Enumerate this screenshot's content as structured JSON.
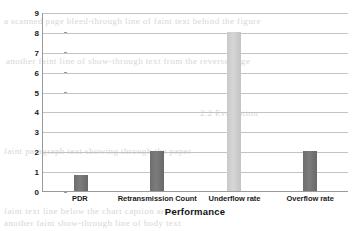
{
  "chart_data": {
    "type": "bar",
    "title": "",
    "xlabel": "Performance",
    "ylabel": "Approximation time (m/sec)",
    "categories": [
      "PDR",
      "Retransmission Count",
      "Underflow rate",
      "Overflow rate"
    ],
    "values": [
      0.8,
      2,
      8,
      2
    ],
    "ylim": [
      0,
      9
    ],
    "yticks": [
      0,
      1,
      2,
      3,
      4,
      5,
      6,
      7,
      8,
      9
    ],
    "ytick_labels": [
      "0",
      "1",
      "2",
      "3",
      "4",
      "5",
      "6",
      "7",
      "8",
      "9"
    ],
    "grid": true,
    "legend": "none",
    "bar_colors": [
      "#6e6e6e",
      "#6e6e6e",
      "#c9c9c9",
      "#6e6e6e"
    ],
    "axis_color": "#9a9a9a",
    "gridline_color": "#c3c3c3",
    "background": "#ffffff"
  },
  "artifacts": {
    "line1": "a scanned page bleed-through line of faint text behind the figure",
    "line2": "another faint line of show-through text from the reverse page",
    "line3": "2.2 Evaluation",
    "line4": "faint paragraph text showing through the paper",
    "line5": "faint text line below the chart caption area",
    "line6": "another faint show-through line of body text"
  }
}
